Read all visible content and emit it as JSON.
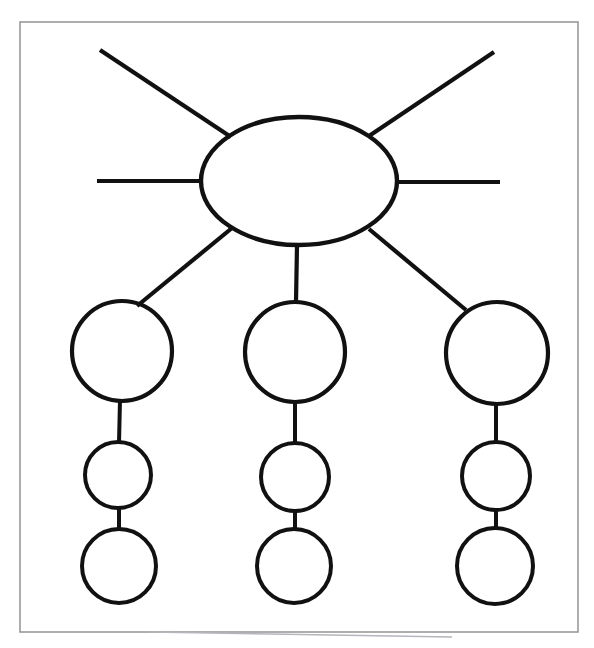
{
  "document": {
    "title": "Blank spider / hierarchy graphic organizer",
    "background_color": "#ffffff",
    "stroke_color": "#111111",
    "frame_color": "#9a9a9a",
    "width": 594,
    "height": 648
  },
  "frame": {
    "name": "page-border",
    "x": 20,
    "y": 22,
    "width": 558,
    "height": 610,
    "stroke": "#9a9a9a",
    "stroke_width": 1.6,
    "fill": "none"
  },
  "artifact": {
    "name": "scan-edge-artifact",
    "x1": 150,
    "y1": 632,
    "x2": 452,
    "y2": 637,
    "stroke": "#b5b5bb",
    "stroke_width": 1.4
  },
  "chart_data": {
    "type": "diagram",
    "title": "",
    "subtitle": "",
    "xlabel": "",
    "ylabel": "",
    "legend": [],
    "annotations": [],
    "nodes": [
      {
        "id": "center",
        "name": "central-ellipse",
        "shape": "ellipse",
        "cx": 299,
        "cy": 181,
        "rx": 98,
        "ry": 64,
        "label": "",
        "fill": "none",
        "stroke": "#111111",
        "stroke_width": 4.4
      },
      {
        "id": "big-left",
        "name": "primary-circle-left",
        "shape": "circle",
        "cx": 122,
        "cy": 351,
        "r": 50,
        "label": "",
        "fill": "none",
        "stroke": "#111111",
        "stroke_width": 4.2
      },
      {
        "id": "big-center",
        "name": "primary-circle-center",
        "shape": "circle",
        "cx": 295,
        "cy": 352,
        "r": 50,
        "label": "",
        "fill": "none",
        "stroke": "#111111",
        "stroke_width": 4.2
      },
      {
        "id": "big-right",
        "name": "primary-circle-right",
        "shape": "circle",
        "cx": 497,
        "cy": 353,
        "r": 51,
        "label": "",
        "fill": "none",
        "stroke": "#111111",
        "stroke_width": 4.2
      },
      {
        "id": "mid-left",
        "name": "secondary-circle-left",
        "shape": "circle",
        "cx": 118,
        "cy": 475,
        "r": 33,
        "label": "",
        "fill": "none",
        "stroke": "#111111",
        "stroke_width": 4.0
      },
      {
        "id": "mid-center",
        "name": "secondary-circle-center",
        "shape": "circle",
        "cx": 295,
        "cy": 477,
        "r": 34,
        "label": "",
        "fill": "none",
        "stroke": "#111111",
        "stroke_width": 4.0
      },
      {
        "id": "mid-right",
        "name": "secondary-circle-right",
        "shape": "circle",
        "cx": 496,
        "cy": 476,
        "r": 34,
        "label": "",
        "fill": "none",
        "stroke": "#111111",
        "stroke_width": 4.0
      },
      {
        "id": "low-left",
        "name": "tertiary-circle-left",
        "shape": "circle",
        "cx": 119,
        "cy": 566,
        "r": 37,
        "label": "",
        "fill": "none",
        "stroke": "#111111",
        "stroke_width": 4.0
      },
      {
        "id": "low-center",
        "name": "tertiary-circle-center",
        "shape": "circle",
        "cx": 294,
        "cy": 566,
        "r": 37,
        "label": "",
        "fill": "none",
        "stroke": "#111111",
        "stroke_width": 4.0
      },
      {
        "id": "low-right",
        "name": "tertiary-circle-right",
        "shape": "circle",
        "cx": 495,
        "cy": 566,
        "r": 38,
        "label": "",
        "fill": "none",
        "stroke": "#111111",
        "stroke_width": 4.0
      }
    ],
    "edges": [
      {
        "id": "spoke-upper-left",
        "name": "spoke-upper-left",
        "from": "center",
        "to": "free-end",
        "x1": 100,
        "y1": 50,
        "x2": 231,
        "y2": 137,
        "stroke_width": 4.2
      },
      {
        "id": "spoke-upper-right",
        "name": "spoke-upper-right",
        "from": "center",
        "to": "free-end",
        "x1": 494,
        "y1": 52,
        "x2": 369,
        "y2": 136,
        "stroke_width": 4.2
      },
      {
        "id": "spoke-left",
        "name": "spoke-left-horizontal",
        "from": "center",
        "to": "free-end",
        "x1": 97,
        "y1": 181,
        "x2": 202,
        "y2": 181,
        "stroke_width": 4.2
      },
      {
        "id": "spoke-right",
        "name": "spoke-right-horizontal",
        "from": "center",
        "to": "free-end",
        "x1": 397,
        "y1": 182,
        "x2": 500,
        "y2": 182,
        "stroke_width": 4.2
      },
      {
        "id": "branch-left",
        "name": "branch-center-to-left-primary",
        "from": "center",
        "to": "big-left",
        "x1": 232,
        "y1": 228,
        "x2": 137,
        "y2": 306,
        "stroke_width": 4.2
      },
      {
        "id": "branch-center",
        "name": "branch-center-to-center-primary",
        "from": "center",
        "to": "big-center",
        "x1": 297,
        "y1": 245,
        "x2": 296,
        "y2": 302,
        "stroke_width": 4.2
      },
      {
        "id": "branch-right",
        "name": "branch-center-to-right-primary",
        "from": "center",
        "to": "big-right",
        "x1": 369,
        "y1": 229,
        "x2": 466,
        "y2": 310,
        "stroke_width": 4.2
      },
      {
        "id": "link-left-1",
        "name": "connector-left-primary-to-secondary",
        "from": "big-left",
        "to": "mid-left",
        "x1": 120,
        "y1": 400,
        "x2": 119,
        "y2": 443,
        "stroke_width": 4.0
      },
      {
        "id": "link-left-2",
        "name": "connector-left-secondary-to-tertiary",
        "from": "mid-left",
        "to": "low-left",
        "x1": 119,
        "y1": 507,
        "x2": 119,
        "y2": 530,
        "stroke_width": 4.0
      },
      {
        "id": "link-center-1",
        "name": "connector-center-primary-to-secondary",
        "from": "big-center",
        "to": "mid-center",
        "x1": 295,
        "y1": 401,
        "x2": 295,
        "y2": 444,
        "stroke_width": 4.0
      },
      {
        "id": "link-center-2",
        "name": "connector-center-secondary-to-tertiary",
        "from": "mid-center",
        "to": "low-center",
        "x1": 295,
        "y1": 510,
        "x2": 295,
        "y2": 530,
        "stroke_width": 4.0
      },
      {
        "id": "link-right-1",
        "name": "connector-right-primary-to-secondary",
        "from": "big-right",
        "to": "mid-right",
        "x1": 496,
        "y1": 403,
        "x2": 496,
        "y2": 443,
        "stroke_width": 4.0
      },
      {
        "id": "link-right-2",
        "name": "connector-right-secondary-to-tertiary",
        "from": "mid-right",
        "to": "low-right",
        "x1": 496,
        "y1": 509,
        "x2": 496,
        "y2": 529,
        "stroke_width": 4.0
      }
    ]
  }
}
